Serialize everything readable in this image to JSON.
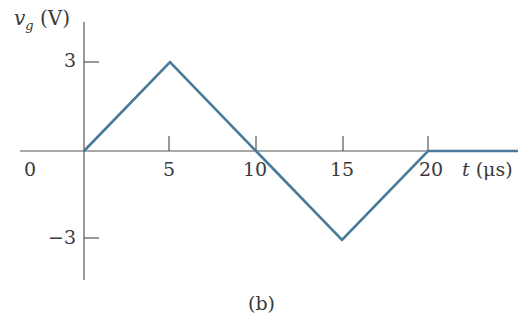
{
  "chart_data": {
    "type": "line",
    "title": "",
    "caption": "(b)",
    "ylabel": "v_g (V)",
    "ylabel_var": "v",
    "ylabel_sub": "g",
    "ylabel_unit": "(V)",
    "xlabel": "t (μs)",
    "xlabel_var": "t",
    "xlabel_unit": "(μs)",
    "x_ticks": [
      0,
      5,
      10,
      15,
      20
    ],
    "x_tick_labels": [
      "0",
      "5",
      "10",
      "15",
      "20"
    ],
    "y_ticks": [
      3,
      -3
    ],
    "y_tick_labels": [
      "3",
      "−3"
    ],
    "xlim": [
      0,
      25
    ],
    "ylim": [
      -4,
      4
    ],
    "grid": false,
    "series": [
      {
        "name": "v_g",
        "color": "#4a7a9a",
        "x": [
          0,
          5,
          10,
          15,
          20,
          25
        ],
        "y": [
          0,
          3,
          0,
          -3,
          0,
          0
        ]
      }
    ]
  }
}
